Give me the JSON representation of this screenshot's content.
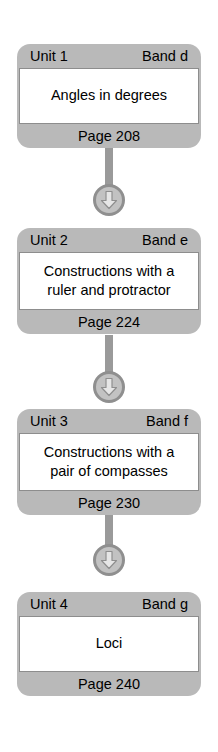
{
  "diagram": {
    "type": "vertical-flowchart",
    "title": "",
    "orientation": "top-to-bottom",
    "connector_icon": "down-arrow-circle-icon",
    "colors": {
      "card_background": "#b9b9b9",
      "card_body": "#ffffff",
      "connector": "#9a9a9a",
      "text": "#000000",
      "page_background": "#ffffff"
    },
    "nodes": [
      {
        "unit": "Unit 1",
        "band": "Band d",
        "title": "Angles in degrees",
        "page": "Page 208",
        "lines": 1
      },
      {
        "unit": "Unit 2",
        "band": "Band e",
        "title": "Constructions with a ruler and protractor",
        "title_line1": "Constructions with a",
        "title_line2": "ruler and protractor",
        "page": "Page 224",
        "lines": 2
      },
      {
        "unit": "Unit 3",
        "band": "Band f",
        "title": "Constructions with a pair of compasses",
        "title_line1": "Constructions with a",
        "title_line2": "pair of compasses",
        "page": "Page 230",
        "lines": 2
      },
      {
        "unit": "Unit 4",
        "band": "Band g",
        "title": "Loci",
        "page": "Page 240",
        "lines": 1
      }
    ]
  }
}
